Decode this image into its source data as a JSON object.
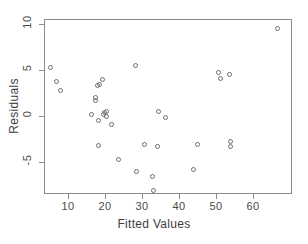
{
  "chart_data": {
    "type": "scatter",
    "title": "",
    "xlabel": "Fitted Values",
    "ylabel": "Residuals",
    "xlim": [
      3.5,
      70.5
    ],
    "ylim": [
      -8.5,
      10.5
    ],
    "xticks": [
      10,
      20,
      30,
      40,
      50,
      60
    ],
    "yticks": [
      10,
      5,
      0,
      -5
    ],
    "grid": false,
    "legend": null,
    "marker": "open-circle",
    "marker_color": "#6f6f6f",
    "points": [
      {
        "x": 5.3,
        "y": 5.2
      },
      {
        "x": 6.9,
        "y": 3.7
      },
      {
        "x": 7.9,
        "y": 2.7
      },
      {
        "x": 16.2,
        "y": 0.1
      },
      {
        "x": 17.3,
        "y": 1.7
      },
      {
        "x": 17.5,
        "y": 2.0
      },
      {
        "x": 17.9,
        "y": 3.3
      },
      {
        "x": 18.1,
        "y": -0.5
      },
      {
        "x": 18.2,
        "y": -3.2
      },
      {
        "x": 18.6,
        "y": 3.4
      },
      {
        "x": 19.4,
        "y": 3.9
      },
      {
        "x": 19.7,
        "y": 0.1
      },
      {
        "x": 19.8,
        "y": 0.3
      },
      {
        "x": 20.3,
        "y": 0.5
      },
      {
        "x": 20.4,
        "y": -0.1
      },
      {
        "x": 21.6,
        "y": -1.0
      },
      {
        "x": 23.7,
        "y": -4.8
      },
      {
        "x": 28.2,
        "y": 5.4
      },
      {
        "x": 28.4,
        "y": -6.1
      },
      {
        "x": 30.6,
        "y": -3.1
      },
      {
        "x": 32.8,
        "y": -6.6
      },
      {
        "x": 33.0,
        "y": -8.1
      },
      {
        "x": 34.2,
        "y": -3.3
      },
      {
        "x": 34.5,
        "y": 0.5
      },
      {
        "x": 36.4,
        "y": -0.2
      },
      {
        "x": 44.0,
        "y": -5.8
      },
      {
        "x": 45.0,
        "y": -3.1
      },
      {
        "x": 50.6,
        "y": 4.7
      },
      {
        "x": 51.1,
        "y": 4.0
      },
      {
        "x": 53.6,
        "y": 4.5
      },
      {
        "x": 53.8,
        "y": -2.8
      },
      {
        "x": 53.8,
        "y": -3.3
      },
      {
        "x": 66.6,
        "y": 9.5
      }
    ]
  }
}
